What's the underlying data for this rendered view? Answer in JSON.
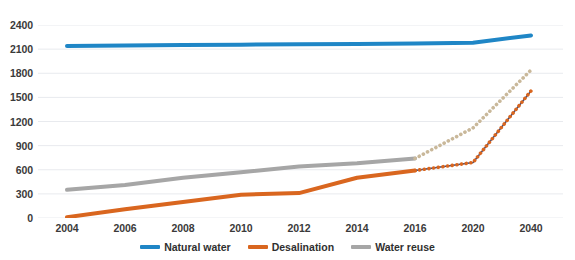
{
  "chart_data": {
    "type": "line",
    "title": "",
    "xlabel": "",
    "ylabel": "",
    "categories": [
      "2004",
      "2006",
      "2008",
      "2010",
      "2012",
      "2014",
      "2016",
      "2020",
      "2040"
    ],
    "ylim": [
      0,
      2400
    ],
    "yticks": [
      0,
      300,
      600,
      900,
      1200,
      1500,
      1800,
      2100,
      2400
    ],
    "grid": true,
    "legend_position": "bottom",
    "series": [
      {
        "name": "Natural water",
        "color": "#1F86C6",
        "style": "solid",
        "values": [
          2140,
          2145,
          2150,
          2155,
          2160,
          2165,
          2170,
          2180,
          2270
        ]
      },
      {
        "name": "Desalination",
        "color": "#D9661F",
        "style": "solid-then-dotted",
        "forecast_from": "2016",
        "values": [
          10,
          110,
          200,
          290,
          310,
          500,
          590,
          690,
          1580
        ]
      },
      {
        "name": "Water reuse",
        "color": "#A6A6A6",
        "forecast_color": "#C9B89A",
        "style": "solid-then-dotted",
        "forecast_from": "2016",
        "values": [
          350,
          410,
          500,
          570,
          640,
          680,
          740,
          1120,
          1840
        ]
      }
    ]
  },
  "legend": {
    "items": [
      {
        "label": "Natural water",
        "color": "#1F86C6"
      },
      {
        "label": "Desalination",
        "color": "#D9661F"
      },
      {
        "label": "Water reuse",
        "color": "#A6A6A6"
      }
    ]
  },
  "axes": {
    "y_tick_labels": [
      "2400",
      "2100",
      "1800",
      "1500",
      "1200",
      "900",
      "600",
      "300",
      "0"
    ],
    "x_tick_labels": [
      "2004",
      "2006",
      "2008",
      "2010",
      "2012",
      "2014",
      "2016",
      "2020",
      "2040"
    ]
  },
  "colors": {
    "natural_water": "#1F86C6",
    "desalination": "#D9661F",
    "water_reuse": "#A6A6A6",
    "forecast_reuse": "#C9B89A",
    "forecast_desalination_line": "#3B4A7A",
    "gridline": "#E8EAEE",
    "background": "#FFFFFF"
  }
}
